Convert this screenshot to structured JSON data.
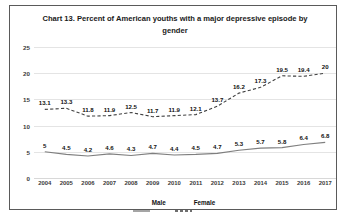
{
  "chart_data": {
    "type": "line",
    "title": "Chart 13. Percent of American youths with a major depressive episode by gender",
    "xlabel": "",
    "ylabel": "",
    "ylim": [
      0,
      25
    ],
    "yticks": [
      0,
      5,
      10,
      15,
      20,
      25
    ],
    "grid": true,
    "legend_position": "bottom",
    "categories": [
      "2004",
      "2005",
      "2006",
      "2007",
      "2008",
      "2009",
      "2010",
      "2011",
      "2012",
      "2013",
      "2014",
      "2015",
      "2016",
      "2017"
    ],
    "series": [
      {
        "name": "Male",
        "style": "solid",
        "color": "#7f7f7f",
        "values": [
          5,
          4.5,
          4.2,
          4.6,
          4.3,
          4.7,
          4.4,
          4.5,
          4.7,
          5.3,
          5.7,
          5.8,
          6.4,
          6.8
        ],
        "labels": [
          "5",
          "4.5",
          "4.2",
          "4.6",
          "4.3",
          "4.7",
          "4.4",
          "4.5",
          "4.7",
          "5.3",
          "5.7",
          "5.8",
          "6.4",
          "6.8"
        ]
      },
      {
        "name": "Female",
        "style": "dashed",
        "color": "#404040",
        "values": [
          13.1,
          13.3,
          11.8,
          11.9,
          12.5,
          11.7,
          11.9,
          12.1,
          13.7,
          16.2,
          17.3,
          19.5,
          19.4,
          20
        ],
        "labels": [
          "13.1",
          "13.3",
          "11.8",
          "11.9",
          "12.5",
          "11.7",
          "11.9",
          "12.1",
          "13.7",
          "16.2",
          "17.3",
          "19.5",
          "19.4",
          "20"
        ]
      }
    ]
  },
  "legend": {
    "items": [
      {
        "label": "Male"
      },
      {
        "label": "Female"
      }
    ]
  }
}
